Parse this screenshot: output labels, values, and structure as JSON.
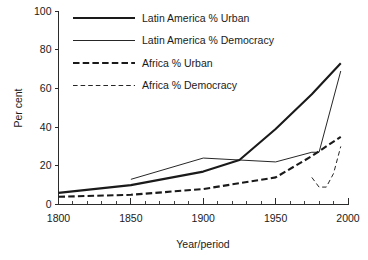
{
  "chart_data": {
    "type": "line",
    "title": "",
    "xlabel": "Year/period",
    "ylabel": "Per cent",
    "xlim": [
      1800,
      2000
    ],
    "ylim": [
      0,
      100
    ],
    "xticks": [
      1800,
      1850,
      1900,
      1950,
      2000
    ],
    "xtick_labels": [
      "1800",
      "1850",
      "1900",
      "1950",
      "2000"
    ],
    "x_minor_tick_step": 10,
    "yticks": [
      0,
      20,
      40,
      60,
      80,
      100
    ],
    "ytick_labels": [
      "0",
      "20",
      "40",
      "60",
      "80",
      "100"
    ],
    "grid": false,
    "legend_position": "top-center",
    "series": [
      {
        "name": "Latin America % Urban",
        "style": "thick-solid",
        "color": "#1a1a1a",
        "x": [
          1800,
          1850,
          1900,
          1925,
          1950,
          1975,
          1995
        ],
        "values": [
          6,
          10,
          17,
          23,
          39,
          57,
          73
        ]
      },
      {
        "name": "Latin America % Democracy",
        "style": "thin-solid",
        "color": "#1a1a1a",
        "x": [
          1850,
          1900,
          1925,
          1950,
          1975,
          1980,
          1995
        ],
        "values": [
          13,
          24,
          23,
          22,
          27,
          27,
          69
        ]
      },
      {
        "name": "Africa % Urban",
        "style": "thick-dash",
        "color": "#1a1a1a",
        "x": [
          1800,
          1850,
          1900,
          1925,
          1950,
          1975,
          1995
        ],
        "values": [
          4,
          5,
          8,
          11,
          14,
          25,
          35
        ]
      },
      {
        "name": "Africa % Democracy",
        "style": "thin-dash",
        "color": "#1a1a1a",
        "x": [
          1975,
          1980,
          1985,
          1990,
          1995
        ],
        "values": [
          14,
          9,
          9,
          16,
          30
        ]
      }
    ]
  },
  "legend": {
    "entries": [
      {
        "label": "Latin America % Urban",
        "style": "thick-solid"
      },
      {
        "label": "Latin America % Democracy",
        "style": "thin-solid"
      },
      {
        "label": "Africa % Urban",
        "style": "thick-dash"
      },
      {
        "label": "Africa % Democracy",
        "style": "thin-dash"
      }
    ]
  },
  "axes": {
    "y_title": "Per cent",
    "x_title": "Year/period"
  }
}
